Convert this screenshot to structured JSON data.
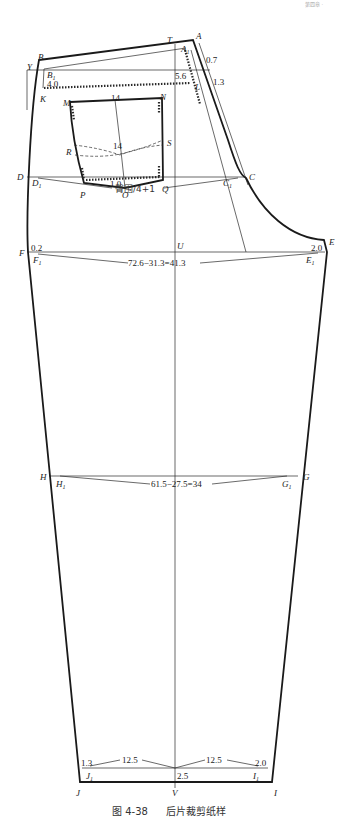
{
  "header": {
    "corner_text": "第四章 ·"
  },
  "caption": {
    "figure_no": "图 4-38",
    "title": "后片裁剪纸样"
  },
  "points": {
    "A": "A",
    "A1": "A",
    "A1_sub": "1",
    "T": "T",
    "B": "B",
    "B1": "B",
    "B1_sub": "1",
    "Y": "Y",
    "K": "K",
    "L": "L",
    "M": "M",
    "N": "N",
    "R": "R",
    "S": "S",
    "P": "P",
    "O": "O",
    "Q": "Q",
    "D": "D",
    "D1": "D",
    "D1_sub": "1",
    "C": "C",
    "C1": "C",
    "C1_sub": "1",
    "F": "F",
    "F1": "F",
    "F1_sub": "1",
    "U": "U",
    "E": "E",
    "E1": "E",
    "E1_sub": "1",
    "H": "H",
    "H1": "H",
    "H1_sub": "1",
    "G": "G",
    "G1": "G",
    "G1_sub": "1",
    "J": "J",
    "J1": "J",
    "J1_sub": "1",
    "V": "V",
    "I": "I",
    "I1": "I",
    "I1_sub": "1"
  },
  "dimensions": {
    "waist_offset": "0.7",
    "yoke_offset": "1.3",
    "yoke_depth_side": "4.0",
    "yoke_depth_center": "5.6",
    "pocket_width_top": "14",
    "pocket_width_mid": "14",
    "pocket_point": "1.0",
    "hip_formula": "臀围/4+1",
    "crotch_in": "0.2",
    "crotch_ext": "2.0",
    "thigh_formula": "72.6−31.3=41.3",
    "knee_formula": "61.5−27.5=34",
    "hem_left_in": "1.3",
    "hem_left_half": "12.5",
    "hem_right_half": "12.5",
    "hem_right_in": "2.0",
    "hem_center_drop": "2.5"
  }
}
